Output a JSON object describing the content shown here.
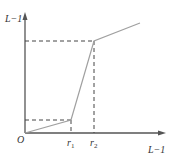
{
  "diagram": {
    "type": "piecewise-linear-transform",
    "y_axis_label": "L−1",
    "x_axis_label": "L−1",
    "origin_label": "O",
    "x_tick_labels": [
      {
        "base": "r",
        "sub": "1"
      },
      {
        "base": "r",
        "sub": "2"
      }
    ],
    "colors": {
      "axis": "#555555",
      "curve": "#a0a0a0",
      "dashed": "#444444"
    }
  }
}
